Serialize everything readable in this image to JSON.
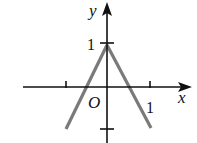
{
  "diagram": {
    "type": "function-graph",
    "axes": {
      "x_label": "x",
      "y_label": "y",
      "origin_label": "O",
      "x_tick_label": "1",
      "y_tick_label": "1"
    },
    "curve": {
      "description": "V-shaped (inverted) graph peaking at (0,1), crossing x-axis at about ±0.5, descending to y=-1 at x=±1",
      "points": [
        [
          -1,
          -1
        ],
        [
          0,
          1
        ],
        [
          1,
          -1
        ]
      ],
      "color": "#7a7a7a"
    },
    "colors": {
      "axis": "#111111",
      "curve": "#7a7a7a"
    }
  }
}
